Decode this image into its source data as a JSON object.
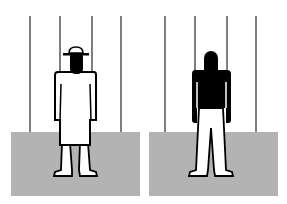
{
  "illustration": {
    "description": "Two pictogram figures standing behind vertical bars on a gray floor",
    "colors": {
      "background": "#ffffff",
      "floor": "#b3b3b3",
      "bars": "#555555",
      "figure_fill_dark": "#000000",
      "figure_fill_light": "#ffffff",
      "outline": "#000000"
    },
    "panels": [
      {
        "id": "left",
        "figure": "person-with-hat-in-robe-icon",
        "bars_x": [
          30,
          60,
          92,
          121
        ],
        "floor": {
          "x": 11,
          "y": 132,
          "w": 129,
          "h": 64
        }
      },
      {
        "id": "right",
        "figure": "person-dark-torso-icon",
        "bars_x": [
          165,
          195,
          227,
          256
        ],
        "floor": {
          "x": 149,
          "y": 132,
          "w": 129,
          "h": 64
        }
      }
    ]
  }
}
